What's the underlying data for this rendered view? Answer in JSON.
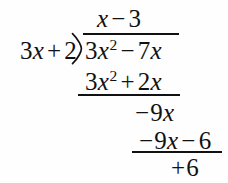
{
  "figure": {
    "type": "polynomial-long-division",
    "background_color": "#fefefe",
    "ink_color": "#111111"
  },
  "quotient": {
    "term1_var": "x",
    "operator": "−",
    "term2_num": "3",
    "full_text": "x − 3"
  },
  "divisor": {
    "coefficient": "3",
    "variable": "x",
    "operator": "+",
    "constant": "2",
    "full_text": "3x + 2"
  },
  "dividend": {
    "coefficient": "3",
    "variable": "x",
    "exponent": "2",
    "operator": "−",
    "term2_coefficient": "7",
    "term2_variable": "x",
    "full_text": "3x² − 7x"
  },
  "subtrahend_one": {
    "coefficient": "3",
    "variable": "x",
    "exponent": "2",
    "operator": "+",
    "term2_coefficient": "2",
    "term2_variable": "x",
    "full_text": "3x² + 2x"
  },
  "partial_remainder": {
    "sign": "−",
    "coefficient": "9",
    "variable": "x",
    "full_text": "−9x"
  },
  "subtrahend_two": {
    "sign": "−",
    "coefficient": "9",
    "variable": "x",
    "operator": "−",
    "constant": "6",
    "full_text": "−9x − 6"
  },
  "final_remainder": {
    "operator": "+",
    "constant": "6",
    "full_text": "+ 6"
  },
  "icons": {
    "division_bracket": "long-division-bracket"
  }
}
